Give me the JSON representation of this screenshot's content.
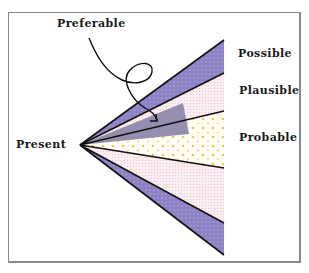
{
  "diagram": {
    "labels": {
      "preferable": "Preferable",
      "possible": "Possible",
      "plausible": "Plausible",
      "probable": "Probable",
      "present": "Present"
    },
    "colors": {
      "possible": "#8e80c4",
      "plausible": "#f7e6ea",
      "probable": "#fffdf5",
      "probable_dots": "#f2c64e",
      "preferable": "#8c86a8",
      "lines": "#111111",
      "frame": "#8a8a8a"
    },
    "regions": [
      {
        "name": "Possible",
        "order": "outermost"
      },
      {
        "name": "Plausible",
        "order": "middle"
      },
      {
        "name": "Probable",
        "order": "inner"
      },
      {
        "name": "Preferable",
        "order": "overlay wedge"
      }
    ]
  }
}
